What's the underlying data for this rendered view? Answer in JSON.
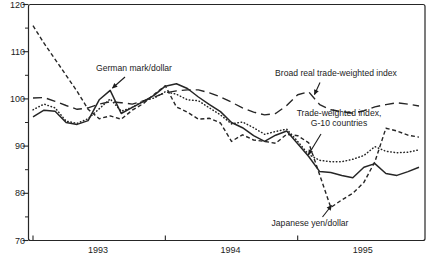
{
  "figure": {
    "ink_color": "#262626",
    "background_color": "#ffffff"
  },
  "chart_data": {
    "type": "line",
    "frequency": "monthly",
    "grid": false,
    "legend": "inline-annotations",
    "ylim": [
      70,
      120
    ],
    "y_ticks": [
      70,
      80,
      90,
      100,
      110,
      120
    ],
    "y_minor_ticks": [
      75,
      85,
      95,
      105,
      115
    ],
    "x_year_labels": [
      "1993",
      "1994",
      "1995"
    ],
    "categories": [
      "1993-01",
      "1993-02",
      "1993-03",
      "1993-04",
      "1993-05",
      "1993-06",
      "1993-07",
      "1993-08",
      "1993-09",
      "1993-10",
      "1993-11",
      "1993-12",
      "1994-01",
      "1994-02",
      "1994-03",
      "1994-04",
      "1994-05",
      "1994-06",
      "1994-07",
      "1994-08",
      "1994-09",
      "1994-10",
      "1994-11",
      "1994-12",
      "1995-01",
      "1995-02",
      "1995-03",
      "1995-04",
      "1995-05",
      "1995-06",
      "1995-07",
      "1995-08",
      "1995-09",
      "1995-10",
      "1995-11",
      "1995-12"
    ],
    "series": [
      {
        "id": "broad_real",
        "label": "Broad real trade-weighted index",
        "style": "long-dash",
        "values": [
          100.2,
          100.3,
          99.5,
          98.6,
          97.8,
          98.1,
          98.9,
          99.4,
          99.2,
          98.9,
          99.6,
          100.4,
          101.3,
          101.7,
          101.9,
          101.9,
          101.3,
          100.4,
          99.3,
          98.1,
          97.2,
          96.6,
          96.9,
          98.6,
          100.9,
          101.5,
          98.8,
          97.7,
          97.3,
          97.0,
          97.5,
          98.3,
          98.8,
          99.2,
          98.9,
          98.5
        ]
      },
      {
        "id": "g10",
        "label": "Trade-weighted index, G-10 countries",
        "style": "dotted",
        "values": [
          97.7,
          98.9,
          98.1,
          95.3,
          94.8,
          95.8,
          97.9,
          100.0,
          97.4,
          98.2,
          99.6,
          100.2,
          101.5,
          101.0,
          99.8,
          99.6,
          98.1,
          96.6,
          94.7,
          95.1,
          93.9,
          92.5,
          93.1,
          93.6,
          91.0,
          88.2,
          87.0,
          86.7,
          86.7,
          87.2,
          88.0,
          89.9,
          88.9,
          88.6,
          88.7,
          89.2
        ]
      },
      {
        "id": "yen",
        "label": "Japanese yen/dollar",
        "style": "short-dash",
        "values": [
          115.5,
          111.8,
          108.4,
          105.0,
          101.6,
          97.8,
          95.8,
          96.4,
          95.7,
          97.6,
          99.0,
          101.0,
          102.8,
          98.3,
          97.2,
          95.7,
          95.9,
          94.9,
          91.0,
          92.4,
          91.3,
          91.0,
          90.6,
          92.5,
          92.2,
          90.7,
          83.9,
          77.0,
          78.6,
          80.0,
          82.3,
          86.7,
          93.8,
          93.2,
          92.3,
          91.9
        ]
      },
      {
        "id": "german_mark",
        "label": "German mark/dollar",
        "style": "solid",
        "values": [
          96.2,
          97.6,
          97.4,
          95.0,
          94.6,
          95.4,
          99.8,
          101.8,
          96.9,
          98.2,
          99.4,
          100.8,
          102.7,
          103.2,
          102.2,
          100.4,
          98.8,
          97.3,
          95.0,
          93.9,
          92.2,
          91.0,
          92.3,
          93.2,
          90.5,
          87.8,
          84.6,
          84.4,
          83.8,
          83.3,
          85.5,
          86.3,
          84.2,
          83.8,
          84.6,
          85.5
        ]
      }
    ],
    "annotations": [
      {
        "id": "german-mark-label",
        "series": "german_mark",
        "lines": [
          "German mark/dollar"
        ],
        "x": 134,
        "y": 71,
        "arrow": [
          125,
          77,
          112.5,
          88
        ]
      },
      {
        "id": "broad-label",
        "series": "broad_real",
        "lines": [
          "Broad real trade-weighted index"
        ],
        "x": 336,
        "y": 76,
        "arrow": [
          320,
          82.5,
          314.5,
          94.5
        ]
      },
      {
        "id": "g10-label",
        "series": "g10",
        "lines": [
          "Trade-weighted index,",
          "G-10 countries"
        ],
        "x": 339,
        "y": 116,
        "arrow": [
          321,
          134,
          308.5,
          154.5
        ]
      },
      {
        "id": "yen-label",
        "series": "yen",
        "lines": [
          "Japanese yen/dollar"
        ],
        "x": 310,
        "y": 226,
        "arrow": [
          322.5,
          217,
          331.5,
          205.5
        ]
      }
    ]
  }
}
